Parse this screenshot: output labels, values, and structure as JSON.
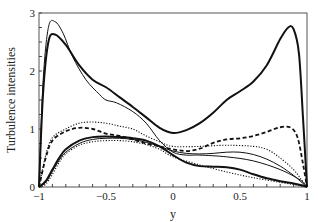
{
  "chart_data": {
    "type": "line",
    "title": "",
    "xlabel": "y",
    "ylabel": "Turbulence intensities",
    "xlim": [
      -1,
      1
    ],
    "ylim": [
      0,
      3
    ],
    "xticks": [
      "-1",
      "-0.5",
      "0",
      "0.5",
      "1"
    ],
    "yticks": [
      "0",
      "1",
      "2",
      "3"
    ],
    "grid": false,
    "legend": null,
    "series": [
      {
        "name": "thick solid (upper)",
        "style": "thick-solid",
        "x": [
          -1,
          -0.97,
          -0.93,
          -0.88,
          -0.8,
          -0.7,
          -0.6,
          -0.5,
          -0.4,
          -0.3,
          -0.2,
          -0.1,
          0,
          0.1,
          0.2,
          0.3,
          0.4,
          0.5,
          0.6,
          0.7,
          0.8,
          0.86,
          0.9,
          0.94,
          0.97,
          1
        ],
        "y": [
          0,
          1.6,
          2.5,
          2.63,
          2.45,
          2.1,
          1.85,
          1.72,
          1.55,
          1.38,
          1.2,
          1.02,
          0.93,
          0.98,
          1.1,
          1.28,
          1.5,
          1.65,
          1.82,
          2.1,
          2.55,
          2.75,
          2.72,
          2.3,
          1.2,
          0
        ]
      },
      {
        "name": "thin solid (upper)",
        "style": "thin-solid",
        "x": [
          -1,
          -0.97,
          -0.93,
          -0.88,
          -0.82,
          -0.75,
          -0.65,
          -0.55,
          -0.5,
          -0.42,
          -0.3,
          -0.2,
          -0.1,
          0,
          0.1,
          0.2,
          0.4,
          0.6,
          0.8,
          0.95,
          1
        ],
        "y": [
          0,
          1.8,
          2.75,
          2.85,
          2.65,
          2.25,
          1.85,
          1.6,
          1.5,
          1.45,
          1.3,
          1.1,
          0.8,
          0.6,
          0.55,
          0.55,
          0.52,
          0.45,
          0.3,
          0.12,
          0
        ]
      },
      {
        "name": "thick dashed",
        "style": "thick-dashed",
        "x": [
          -1,
          -0.95,
          -0.9,
          -0.8,
          -0.7,
          -0.6,
          -0.5,
          -0.4,
          -0.3,
          -0.2,
          -0.1,
          0,
          0.1,
          0.2,
          0.3,
          0.4,
          0.5,
          0.6,
          0.7,
          0.8,
          0.88,
          0.93,
          0.97,
          1
        ],
        "y": [
          0,
          0.5,
          0.8,
          0.96,
          1.02,
          1.0,
          0.92,
          0.88,
          0.82,
          0.75,
          0.7,
          0.65,
          0.62,
          0.66,
          0.76,
          0.82,
          0.84,
          0.88,
          0.95,
          1.03,
          1.02,
          0.85,
          0.4,
          0
        ]
      },
      {
        "name": "thin dotted (upper)",
        "style": "dotted",
        "x": [
          -1,
          -0.95,
          -0.9,
          -0.8,
          -0.7,
          -0.6,
          -0.5,
          -0.4,
          -0.3,
          -0.2,
          -0.1,
          0,
          0.2,
          0.4,
          0.6,
          0.7,
          0.8,
          0.9,
          0.96,
          1
        ],
        "y": [
          0,
          0.55,
          0.85,
          1.0,
          1.1,
          1.12,
          1.1,
          1.05,
          1.0,
          0.88,
          0.78,
          0.7,
          0.7,
          0.72,
          0.7,
          0.65,
          0.5,
          0.3,
          0.12,
          0
        ]
      },
      {
        "name": "thick solid (lower)",
        "style": "thick-solid",
        "x": [
          -1,
          -0.95,
          -0.9,
          -0.85,
          -0.8,
          -0.7,
          -0.6,
          -0.5,
          -0.4,
          -0.3,
          -0.2,
          -0.1,
          0,
          0.1,
          0.2,
          0.3,
          0.4,
          0.5,
          0.6,
          0.7,
          0.8,
          0.9,
          0.96,
          1
        ],
        "y": [
          0,
          0.1,
          0.3,
          0.5,
          0.65,
          0.8,
          0.86,
          0.87,
          0.86,
          0.84,
          0.8,
          0.7,
          0.55,
          0.42,
          0.36,
          0.35,
          0.34,
          0.3,
          0.22,
          0.15,
          0.1,
          0.06,
          0.03,
          0
        ]
      },
      {
        "name": "thin dotted (lower)",
        "style": "dotted",
        "x": [
          -1,
          -0.95,
          -0.9,
          -0.85,
          -0.8,
          -0.7,
          -0.6,
          -0.5,
          -0.4,
          -0.3,
          -0.2,
          -0.1,
          0,
          0.2,
          0.4,
          0.6,
          0.8,
          0.95,
          1
        ],
        "y": [
          0,
          0.05,
          0.22,
          0.42,
          0.57,
          0.72,
          0.78,
          0.8,
          0.8,
          0.78,
          0.73,
          0.65,
          0.52,
          0.38,
          0.26,
          0.16,
          0.08,
          0.02,
          0
        ]
      },
      {
        "name": "thin solid (lower)",
        "style": "thin-solid",
        "x": [
          -1,
          -0.95,
          -0.9,
          -0.85,
          -0.8,
          -0.7,
          -0.6,
          -0.5,
          -0.4,
          -0.3,
          -0.2,
          -0.1,
          0,
          0.1,
          0.2,
          0.3,
          0.4,
          0.5,
          0.6,
          0.7,
          0.8,
          0.9,
          0.95,
          1
        ],
        "y": [
          0,
          0.08,
          0.27,
          0.46,
          0.6,
          0.75,
          0.82,
          0.84,
          0.84,
          0.82,
          0.77,
          0.7,
          0.62,
          0.58,
          0.57,
          0.58,
          0.6,
          0.6,
          0.56,
          0.48,
          0.36,
          0.2,
          0.1,
          0
        ]
      }
    ]
  }
}
